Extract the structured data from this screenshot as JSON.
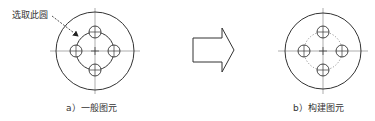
{
  "annotation": {
    "text": "选取此圆"
  },
  "figures": [
    {
      "id": "a",
      "caption": "a）一般图元",
      "inner_circle_style": "solid"
    },
    {
      "id": "b",
      "caption": "b）构建图元",
      "inner_circle_style": "dotted"
    }
  ],
  "arrow": {
    "direction": "right",
    "style": "block-outline"
  },
  "colors": {
    "stroke": "#333333",
    "centerline": "#666666",
    "dotted": "#777777"
  }
}
